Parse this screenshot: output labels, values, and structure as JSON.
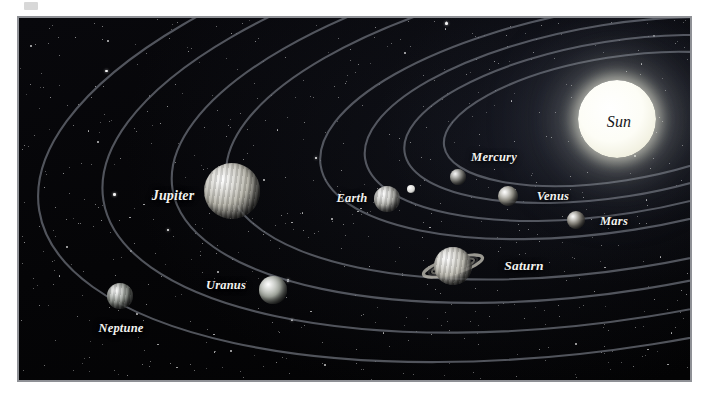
{
  "figure": {
    "kind": "solar-system-diagram",
    "title_visible": false,
    "frame": {
      "x": 17,
      "y": 16,
      "width": 675,
      "height": 366,
      "border_color": "#8f9196",
      "background_color": "#060608"
    }
  },
  "sun": {
    "label": "Sun",
    "label_color": "#16161a",
    "cx": 617,
    "cy": 119,
    "r": 39,
    "font_size": 16
  },
  "planets": [
    {
      "name": "Mercury",
      "label": "Mercury",
      "cx": 458,
      "cy": 177,
      "r": 8,
      "color": "#9a9a94",
      "label_x": 494,
      "label_y": 157,
      "font_size": 12.5
    },
    {
      "name": "Venus",
      "label": "Venus",
      "cx": 508,
      "cy": 196,
      "r": 10,
      "color": "#a8a69b",
      "label_x": 553,
      "label_y": 196,
      "font_size": 12.5
    },
    {
      "name": "Earth",
      "label": "Earth",
      "cx": 387,
      "cy": 199,
      "r": 13,
      "color": "#b6b6b0",
      "label_x": 352,
      "label_y": 198,
      "font_size": 12.5
    },
    {
      "name": "Mars",
      "label": "Mars",
      "cx": 576,
      "cy": 220,
      "r": 9,
      "color": "#9b978d",
      "label_x": 614,
      "label_y": 221,
      "font_size": 12.5
    },
    {
      "name": "Jupiter",
      "label": "Jupiter",
      "cx": 232,
      "cy": 191,
      "r": 28,
      "color": "#b3b1a6",
      "label_x": 173,
      "label_y": 196,
      "font_size": 14
    },
    {
      "name": "Saturn",
      "label": "Saturn",
      "cx": 453,
      "cy": 266,
      "r": 19,
      "color": "#bcbab0",
      "label_x": 524,
      "label_y": 266,
      "font_size": 13.5
    },
    {
      "name": "Uranus",
      "label": "Uranus",
      "cx": 273,
      "cy": 290,
      "r": 14,
      "color": "#a3a89f",
      "label_x": 226,
      "label_y": 285,
      "font_size": 12.5
    },
    {
      "name": "Neptune",
      "label": "Neptune",
      "cx": 120,
      "cy": 296,
      "r": 13,
      "color": "#8e938c",
      "label_x": 121,
      "label_y": 328,
      "font_size": 12.5
    }
  ],
  "moon": {
    "name": "Moon",
    "cx": 411,
    "cy": 189,
    "r": 4,
    "color": "#d6d6d2"
  },
  "orbits": [
    {
      "for": "Mercury",
      "rx": 175,
      "ry": 62
    },
    {
      "for": "Venus",
      "rx": 215,
      "ry": 78
    },
    {
      "for": "Earth",
      "rx": 255,
      "ry": 95
    },
    {
      "for": "Mars",
      "rx": 300,
      "ry": 112
    },
    {
      "for": "Jupiter",
      "rx": 395,
      "ry": 150
    },
    {
      "for": "Saturn",
      "rx": 450,
      "ry": 172
    },
    {
      "for": "Uranus",
      "rx": 520,
      "ry": 200
    },
    {
      "for": "Neptune",
      "rx": 585,
      "ry": 228
    }
  ],
  "orbit_center": {
    "cx": 617,
    "cy": 119
  },
  "orbit_style": {
    "color": "#6f737d",
    "width": 2.1,
    "opacity": 0.72
  },
  "colors": {
    "space": "#060608",
    "frame_border": "#8f9196",
    "star": "#ffffff",
    "label_text": "#f2f2ef",
    "sun_core": "#ffffff",
    "orbit_line": "#6f737d",
    "page_background": "#ffffff"
  }
}
